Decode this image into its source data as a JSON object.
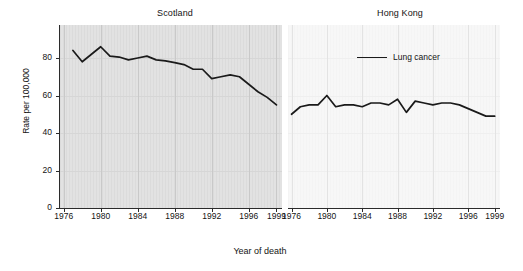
{
  "chart_data": {
    "type": "line",
    "title": "",
    "xlabel": "Year of death",
    "ylabel": "Rate per 100,000",
    "xlim": [
      1975.5,
      1999.5
    ],
    "ylim": [
      0,
      90
    ],
    "grid": true,
    "legend_position": "top-right-of-second-panel",
    "legend": [
      "Lung cancer"
    ],
    "xticks": [
      "1976",
      "1980",
      "1984",
      "1988",
      "1992",
      "1996",
      "1999"
    ],
    "xtick_values": [
      1976,
      1980,
      1984,
      1988,
      1992,
      1996,
      1999
    ],
    "yticks": [
      "0",
      "20",
      "40",
      "60",
      "80"
    ],
    "ytick_values": [
      0,
      20,
      40,
      60,
      80
    ],
    "panels": [
      {
        "title": "Scotland",
        "series": [
          {
            "name": "Lung cancer",
            "x": [
              1977,
              1978,
              1979,
              1980,
              1981,
              1982,
              1983,
              1984,
              1985,
              1986,
              1987,
              1988,
              1989,
              1990,
              1991,
              1992,
              1993,
              1994,
              1995,
              1996,
              1997,
              1998,
              1999
            ],
            "values": [
              84,
              78,
              82,
              86,
              81,
              80.5,
              79,
              80,
              81,
              79,
              78.5,
              77.5,
              76.5,
              74,
              74,
              69,
              70,
              71,
              70,
              66,
              62,
              59,
              55
            ]
          }
        ]
      },
      {
        "title": "Hong Kong",
        "series": [
          {
            "name": "Lung cancer",
            "x": [
              1976,
              1977,
              1978,
              1979,
              1980,
              1981,
              1982,
              1983,
              1984,
              1985,
              1986,
              1987,
              1988,
              1989,
              1990,
              1991,
              1992,
              1993,
              1994,
              1995,
              1996,
              1997,
              1998,
              1999
            ],
            "values": [
              50,
              54,
              55,
              55,
              60,
              54,
              55,
              55,
              54,
              56,
              56,
              55,
              58,
              51,
              57,
              56,
              55,
              56,
              56,
              55,
              53,
              51,
              49,
              49
            ]
          }
        ]
      }
    ],
    "line_color": "#1a1a1a"
  }
}
